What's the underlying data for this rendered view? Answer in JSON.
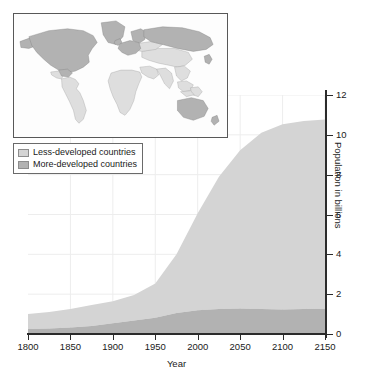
{
  "chart_data": {
    "type": "area",
    "stacked": true,
    "title": "",
    "xlabel": "Year",
    "ylabel": "Population in billions",
    "xlim": [
      1800,
      2150
    ],
    "ylim": [
      0,
      12
    ],
    "xticks": [
      1800,
      1850,
      1900,
      1950,
      2000,
      2050,
      2100,
      2150
    ],
    "xtick_labels": [
      "1800",
      "1850",
      "1900",
      "1950",
      "2000",
      "2050",
      "2100",
      "2150"
    ],
    "yticks": [
      0,
      2,
      4,
      6,
      8,
      10,
      12
    ],
    "ytick_labels": [
      "0",
      "2",
      "4",
      "6",
      "8",
      "10",
      "12"
    ],
    "yaxis_position": "right",
    "grid": true,
    "legend_position": "upper-left",
    "x": [
      1800,
      1825,
      1850,
      1875,
      1900,
      1925,
      1950,
      1975,
      2000,
      2025,
      2050,
      2075,
      2100,
      2125,
      2150
    ],
    "series": [
      {
        "name": "More-developed countries",
        "color": "#b2b2b2",
        "values": [
          0.25,
          0.28,
          0.33,
          0.4,
          0.54,
          0.68,
          0.81,
          1.05,
          1.19,
          1.26,
          1.28,
          1.25,
          1.23,
          1.25,
          1.27
        ]
      },
      {
        "name": "Less-developed countries",
        "color": "#d4d4d4",
        "values": [
          0.75,
          0.83,
          0.92,
          1.05,
          1.11,
          1.28,
          1.72,
          2.95,
          4.87,
          6.63,
          7.95,
          8.85,
          9.3,
          9.45,
          9.5
        ]
      }
    ],
    "totals": [
      1.0,
      1.11,
      1.25,
      1.45,
      1.65,
      1.96,
      2.53,
      4.0,
      6.06,
      7.89,
      9.23,
      10.1,
      10.53,
      10.7,
      10.77
    ]
  },
  "legend": {
    "items": [
      {
        "label": "Less-developed countries",
        "color": "#d4d4d4"
      },
      {
        "label": "More-developed countries",
        "color": "#b2b2b2"
      }
    ]
  },
  "map_inset": {
    "name": "world-map-development-status",
    "more_developed_color": "#b2b2b2",
    "less_developed_color": "#dedede",
    "ocean_color": "#fdfdfd",
    "border_color": "#585858",
    "more_developed_regions": [
      "North America",
      "Canada",
      "Greenland",
      "Europe",
      "Russia",
      "Japan",
      "Australia",
      "New Zealand"
    ],
    "less_developed_regions": [
      "Latin America",
      "Africa",
      "Asia",
      "Middle East",
      "Southeast Asia"
    ]
  },
  "colors": {
    "axis": "#2b2b2b",
    "grid": "#ededed",
    "text": "#1a1a1a"
  }
}
